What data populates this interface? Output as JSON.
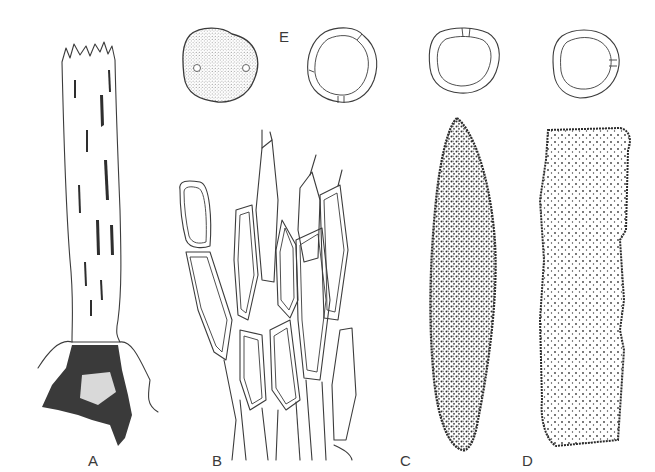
{
  "figure": {
    "panels": [
      {
        "id": "A",
        "label": "A",
        "description": "Elongated stipe with frayed top and dark ragged base"
      },
      {
        "id": "B",
        "label": "B",
        "description": "Elongated cells with double walls (cellular network)"
      },
      {
        "id": "C",
        "label": "C",
        "description": "Spindle-shaped densely stippled structure"
      },
      {
        "id": "D",
        "label": "D",
        "description": "Rectangular lightly stippled structure"
      },
      {
        "id": "E",
        "label": "E",
        "description": "Spores: one stippled surface view and three optical sections with pores"
      }
    ],
    "colors": {
      "background": "#ffffff",
      "ink": "#3c3c3c"
    }
  }
}
